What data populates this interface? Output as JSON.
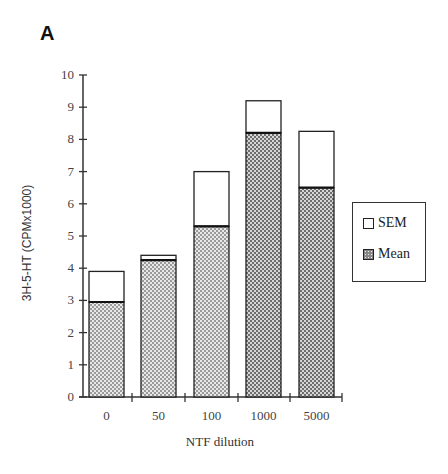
{
  "panel_label": "A",
  "chart_data": {
    "type": "bar",
    "stacked": true,
    "title": "",
    "xlabel": "NTF dilution",
    "ylabel": "3H-5-HT (CPMx1000)",
    "ylim": [
      0,
      10
    ],
    "yticks": [
      0,
      1,
      2,
      3,
      4,
      5,
      6,
      7,
      8,
      9,
      10
    ],
    "grid": false,
    "legend_position": "right",
    "categories": [
      "0",
      "50",
      "100",
      "1000",
      "5000"
    ],
    "series": [
      {
        "name": "Mean",
        "values": [
          2.95,
          4.25,
          5.3,
          8.2,
          6.5
        ],
        "fill": "crosshatch"
      },
      {
        "name": "SEM",
        "values": [
          0.95,
          0.15,
          1.7,
          1.0,
          1.75
        ],
        "fill": "white"
      }
    ],
    "mean_plus_sem": [
      3.9,
      4.4,
      7.0,
      9.2,
      8.25
    ]
  },
  "legend": {
    "items": [
      {
        "label": "SEM"
      },
      {
        "label": "Mean"
      }
    ]
  },
  "colors": {
    "axis": "#333333",
    "mean_fill": "#8a8a8a",
    "sem_fill": "#ffffff",
    "bar_outline": "#222222"
  }
}
